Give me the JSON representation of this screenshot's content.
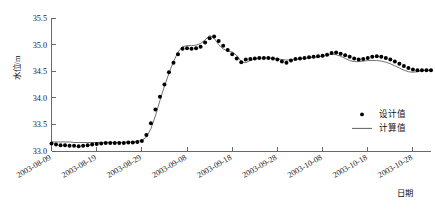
{
  "chart_data": {
    "type": "scatter",
    "title": "",
    "xlabel": "日期",
    "ylabel": "水位/m",
    "ylim": [
      33.0,
      35.5
    ],
    "ytick_labels": [
      "33.0",
      "33.5",
      "34.0",
      "34.5",
      "35.0",
      "35.5"
    ],
    "ytick_values": [
      33.0,
      33.5,
      34.0,
      34.5,
      35.0,
      35.5
    ],
    "xlim": [
      "2003-08-09",
      "2003-11-02"
    ],
    "xtick_labels": [
      "2003-08-09",
      "2003-08-19",
      "2003-08-29",
      "2003-09-08",
      "2003-09-18",
      "2003-09-28",
      "2003-10-08",
      "2003-10-18",
      "2003-10-28"
    ],
    "xtick_day_offsets": [
      0,
      10,
      20,
      30,
      40,
      50,
      60,
      70,
      80
    ],
    "grid": false,
    "legend_position": "lower-right",
    "series": [
      {
        "name": "设计值",
        "marker": "dot",
        "color": "#000000",
        "x_day_offsets": [
          0,
          1,
          2,
          3,
          4,
          5,
          6,
          7,
          8,
          9,
          10,
          11,
          12,
          13,
          14,
          15,
          16,
          17,
          18,
          19,
          20,
          21,
          22,
          23,
          24,
          25,
          26,
          27,
          28,
          29,
          30,
          31,
          32,
          33,
          34,
          35,
          36,
          37,
          38,
          39,
          40,
          41,
          42,
          43,
          44,
          45,
          46,
          47,
          48,
          49,
          50,
          51,
          52,
          53,
          54,
          55,
          56,
          57,
          58,
          59,
          60,
          61,
          62,
          63,
          64,
          65,
          66,
          67,
          68,
          69,
          70,
          71,
          72,
          73,
          74,
          75,
          76,
          77,
          78,
          79,
          80,
          81,
          82,
          83,
          84
        ],
        "values": [
          33.14,
          33.12,
          33.11,
          33.11,
          33.1,
          33.1,
          33.09,
          33.1,
          33.11,
          33.12,
          33.13,
          33.14,
          33.15,
          33.15,
          33.15,
          33.15,
          33.15,
          33.16,
          33.16,
          33.17,
          33.19,
          33.3,
          33.52,
          33.78,
          34.02,
          34.25,
          34.48,
          34.66,
          34.82,
          34.92,
          34.93,
          34.92,
          34.93,
          34.96,
          35.04,
          35.12,
          35.15,
          35.07,
          34.98,
          34.9,
          34.82,
          34.74,
          34.67,
          34.72,
          34.73,
          34.74,
          34.75,
          34.75,
          34.75,
          34.74,
          34.72,
          34.68,
          34.66,
          34.7,
          34.73,
          34.74,
          34.75,
          34.76,
          34.77,
          34.78,
          34.79,
          34.81,
          34.84,
          34.85,
          34.83,
          34.8,
          34.77,
          34.74,
          34.72,
          34.73,
          34.75,
          34.77,
          34.78,
          34.77,
          34.75,
          34.72,
          34.68,
          34.64,
          34.6,
          34.56,
          34.53,
          34.52,
          34.52,
          34.52,
          34.52
        ]
      },
      {
        "name": "计算值",
        "marker": "line",
        "color": "#4d4d4d",
        "x_day_offsets": [
          0,
          1,
          2,
          3,
          4,
          5,
          6,
          7,
          8,
          9,
          10,
          11,
          12,
          13,
          14,
          15,
          16,
          17,
          18,
          19,
          20,
          21,
          22,
          23,
          24,
          25,
          26,
          27,
          28,
          29,
          30,
          31,
          32,
          33,
          34,
          35,
          36,
          37,
          38,
          39,
          40,
          41,
          42,
          43,
          44,
          45,
          46,
          47,
          48,
          49,
          50,
          51,
          52,
          53,
          54,
          55,
          56,
          57,
          58,
          59,
          60,
          61,
          62,
          63,
          64,
          65,
          66,
          67,
          68,
          69,
          70,
          71,
          72,
          73,
          74,
          75,
          76,
          77,
          78,
          79,
          80,
          81,
          82,
          83,
          84
        ],
        "values": [
          33.17,
          33.17,
          33.17,
          33.17,
          33.17,
          33.16,
          33.16,
          33.16,
          33.16,
          33.16,
          33.16,
          33.16,
          33.16,
          33.16,
          33.16,
          33.16,
          33.16,
          33.17,
          33.17,
          33.18,
          33.2,
          33.26,
          33.42,
          33.66,
          33.95,
          34.22,
          34.46,
          34.68,
          34.86,
          34.96,
          34.98,
          34.98,
          34.99,
          35.02,
          35.09,
          35.17,
          35.12,
          35.0,
          34.92,
          34.88,
          34.86,
          34.8,
          34.68,
          34.66,
          34.7,
          34.73,
          34.74,
          34.75,
          34.75,
          34.74,
          34.73,
          34.72,
          34.71,
          34.71,
          34.72,
          34.73,
          34.74,
          34.75,
          34.76,
          34.77,
          34.78,
          34.8,
          34.82,
          34.81,
          34.78,
          34.74,
          34.7,
          34.68,
          34.68,
          34.69,
          34.7,
          34.7,
          34.7,
          34.69,
          34.67,
          34.64,
          34.6,
          34.56,
          34.52,
          34.49,
          34.48,
          34.49,
          34.51,
          34.52,
          34.52
        ]
      }
    ]
  },
  "legend": {
    "entries": [
      {
        "label": "设计值",
        "type": "dot"
      },
      {
        "label": "计算值",
        "type": "line"
      }
    ]
  },
  "axes": {
    "y_title": "水位/m",
    "x_title": "日期"
  }
}
